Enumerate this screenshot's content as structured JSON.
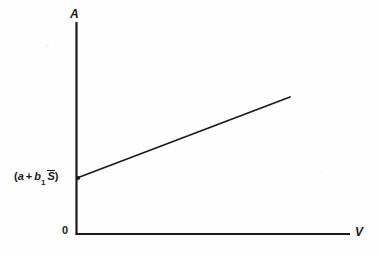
{
  "figure": {
    "background_color": "#fefefe",
    "ink_color": "#1a1a1a"
  },
  "labels": {
    "y_axis": "A",
    "x_axis": "V",
    "origin": "0",
    "intercept_open_paren": "(",
    "intercept_a": "a",
    "intercept_plus": "+",
    "intercept_b": "b",
    "intercept_b_subscript": "1",
    "intercept_s_bar": "S",
    "intercept_close_paren": ")",
    "intercept_full": "(a + b₁ S̅)"
  },
  "chart_data": {
    "type": "line",
    "title": "",
    "xlabel": "V",
    "ylabel": "A",
    "grid": false,
    "legend": false,
    "origin_label": "0",
    "axis_pixels": {
      "y_axis_x": 76,
      "y_axis_top_y": 22,
      "y_axis_bottom_y": 234,
      "x_axis_y": 234,
      "x_axis_left_x": 76,
      "x_axis_right_x": 350
    },
    "series": [
      {
        "name": "A = (a + b₁ S̅) + b₂ V",
        "x": [
          76,
          290
        ],
        "y": [
          178,
          97
        ],
        "intercept_label": "(a + b₁ S̅)",
        "slope_sign": "positive",
        "marker_at_intercept": true
      }
    ],
    "annotations": [
      {
        "text": "(a + b₁ S̅)",
        "target": "y-intercept",
        "x": 76,
        "y": 178
      },
      {
        "text": "A",
        "target": "y-axis-tip",
        "x": 76,
        "y": 22
      },
      {
        "text": "V",
        "target": "x-axis-tip",
        "x": 350,
        "y": 234
      },
      {
        "text": "0",
        "target": "origin",
        "x": 76,
        "y": 234
      }
    ]
  }
}
